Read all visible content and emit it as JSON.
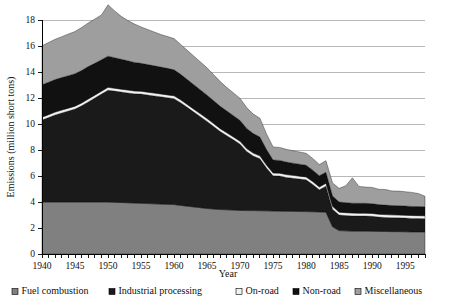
{
  "chart_data": {
    "type": "area",
    "stacked": true,
    "title": "",
    "xlabel": "Year",
    "ylabel": "Emissions (million short tons)",
    "xlim": [
      1940,
      1998
    ],
    "ylim": [
      0,
      18
    ],
    "ytick_step": 2,
    "xtick_step": 1,
    "xtick_label_step": 5,
    "grid": "horizontal",
    "legend_position": "bottom",
    "ytick_labels": [
      "0",
      "2",
      "4",
      "6",
      "8",
      "10",
      "12",
      "14",
      "16",
      "18"
    ],
    "xtick_labels": [
      "1940",
      "1945",
      "1950",
      "1955",
      "1960",
      "1965",
      "1970",
      "1975",
      "1980",
      "1985",
      "1990",
      "1995"
    ],
    "x": [
      1940,
      1941,
      1942,
      1943,
      1944,
      1945,
      1946,
      1947,
      1948,
      1949,
      1950,
      1951,
      1952,
      1953,
      1954,
      1955,
      1956,
      1957,
      1958,
      1959,
      1960,
      1961,
      1962,
      1963,
      1964,
      1965,
      1966,
      1967,
      1968,
      1969,
      1970,
      1971,
      1972,
      1973,
      1974,
      1975,
      1976,
      1977,
      1978,
      1979,
      1980,
      1981,
      1982,
      1983,
      1984,
      1985,
      1986,
      1987,
      1988,
      1989,
      1990,
      1991,
      1992,
      1993,
      1994,
      1995,
      1996,
      1997,
      1998
    ],
    "series": [
      {
        "name": "Fuel combustion",
        "color": "#808080",
        "values": [
          4.0,
          4.0,
          4.0,
          4.0,
          4.0,
          4.0,
          4.0,
          4.0,
          4.0,
          4.0,
          4.0,
          3.98,
          3.96,
          3.94,
          3.92,
          3.9,
          3.88,
          3.86,
          3.84,
          3.82,
          3.8,
          3.74,
          3.68,
          3.62,
          3.56,
          3.5,
          3.46,
          3.42,
          3.4,
          3.38,
          3.35,
          3.34,
          3.34,
          3.33,
          3.32,
          3.31,
          3.3,
          3.29,
          3.28,
          3.27,
          3.26,
          3.25,
          3.24,
          3.22,
          2.1,
          1.8,
          1.78,
          1.76,
          1.76,
          1.76,
          1.75,
          1.74,
          1.73,
          1.72,
          1.72,
          1.71,
          1.7,
          1.7,
          1.7
        ]
      },
      {
        "name": "Industrial processing",
        "color": "#1a1a1a",
        "values": [
          6.3,
          6.5,
          6.7,
          6.85,
          7.0,
          7.15,
          7.4,
          7.7,
          8.0,
          8.3,
          8.6,
          8.55,
          8.5,
          8.45,
          8.4,
          8.4,
          8.35,
          8.3,
          8.25,
          8.2,
          8.15,
          7.9,
          7.6,
          7.3,
          7.0,
          6.7,
          6.35,
          6.0,
          5.7,
          5.4,
          5.1,
          4.55,
          4.2,
          4.0,
          3.3,
          2.7,
          2.7,
          2.6,
          2.55,
          2.5,
          2.45,
          2.1,
          1.7,
          2.0,
          1.35,
          1.2,
          1.18,
          1.17,
          1.16,
          1.16,
          1.15,
          1.1,
          1.08,
          1.07,
          1.06,
          1.05,
          1.04,
          1.03,
          1.02
        ]
      },
      {
        "name": "On-road",
        "color": "#f2f2f2",
        "values": [
          0.22,
          0.22,
          0.22,
          0.22,
          0.22,
          0.22,
          0.22,
          0.22,
          0.22,
          0.22,
          0.22,
          0.22,
          0.22,
          0.22,
          0.22,
          0.22,
          0.22,
          0.22,
          0.22,
          0.22,
          0.22,
          0.22,
          0.22,
          0.22,
          0.22,
          0.22,
          0.22,
          0.22,
          0.22,
          0.22,
          0.22,
          0.22,
          0.22,
          0.22,
          0.22,
          0.22,
          0.22,
          0.22,
          0.22,
          0.22,
          0.22,
          0.22,
          0.22,
          0.22,
          0.22,
          0.22,
          0.22,
          0.22,
          0.22,
          0.22,
          0.22,
          0.22,
          0.22,
          0.22,
          0.22,
          0.22,
          0.22,
          0.22,
          0.22
        ]
      },
      {
        "name": "Non-road",
        "color": "#111111",
        "values": [
          2.5,
          2.5,
          2.5,
          2.5,
          2.5,
          2.5,
          2.5,
          2.5,
          2.45,
          2.42,
          2.4,
          2.35,
          2.3,
          2.25,
          2.2,
          2.15,
          2.12,
          2.1,
          2.07,
          2.04,
          2.0,
          1.96,
          1.92,
          1.88,
          1.84,
          1.8,
          1.76,
          1.72,
          1.68,
          1.64,
          1.6,
          1.55,
          1.5,
          1.45,
          1.2,
          1.0,
          0.98,
          0.96,
          0.94,
          0.92,
          0.9,
          0.88,
          0.86,
          0.84,
          0.8,
          0.78,
          0.77,
          0.76,
          0.76,
          0.76,
          0.75,
          0.74,
          0.73,
          0.72,
          0.72,
          0.71,
          0.7,
          0.7,
          0.7
        ]
      },
      {
        "name": "Miscellaneous",
        "color": "#9e9e9e",
        "values": [
          3.0,
          3.05,
          3.1,
          3.15,
          3.2,
          3.25,
          3.3,
          3.35,
          3.4,
          3.45,
          3.95,
          3.6,
          3.3,
          3.1,
          2.95,
          2.8,
          2.7,
          2.6,
          2.5,
          2.45,
          2.4,
          2.3,
          2.25,
          2.2,
          2.15,
          2.1,
          2.0,
          1.9,
          1.8,
          1.75,
          1.7,
          1.6,
          1.5,
          1.45,
          1.2,
          1.0,
          1.0,
          0.98,
          0.96,
          0.94,
          0.92,
          0.9,
          0.86,
          0.9,
          1.0,
          1.05,
          1.3,
          1.95,
          1.3,
          1.25,
          1.25,
          1.18,
          1.2,
          1.12,
          1.12,
          1.1,
          1.08,
          1.0,
          0.8
        ]
      }
    ]
  }
}
